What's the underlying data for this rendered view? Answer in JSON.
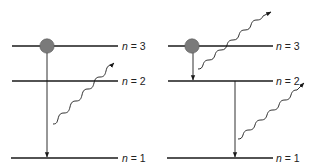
{
  "diagram": {
    "type": "energy-level-diagram",
    "colors": {
      "line": "#1a1a1a",
      "electron": "#7a7a7a",
      "electron_stroke": "#555555",
      "background": "#ffffff"
    },
    "panels": [
      {
        "id": "left",
        "levels": [
          {
            "n_symbol": "n",
            "eq": " = ",
            "value": "3"
          },
          {
            "n_symbol": "n",
            "eq": " = ",
            "value": "2"
          },
          {
            "n_symbol": "n",
            "eq": " = ",
            "value": "1"
          }
        ],
        "electron_at": "n=3",
        "transitions": [
          {
            "from": "n=3",
            "to": "n=1"
          }
        ],
        "photons": [
          {
            "emitted_from_transition": "n=3 to n=1"
          }
        ]
      },
      {
        "id": "right",
        "levels": [
          {
            "n_symbol": "n",
            "eq": " = ",
            "value": "3"
          },
          {
            "n_symbol": "n",
            "eq": " = ",
            "value": "2"
          },
          {
            "n_symbol": "n",
            "eq": " = ",
            "value": "1"
          }
        ],
        "electron_at": "n=3",
        "transitions": [
          {
            "from": "n=3",
            "to": "n=2"
          },
          {
            "from": "n=2",
            "to": "n=1"
          }
        ],
        "photons": [
          {
            "emitted_from_transition": "n=3 to n=2"
          },
          {
            "emitted_from_transition": "n=2 to n=1"
          }
        ]
      }
    ]
  }
}
